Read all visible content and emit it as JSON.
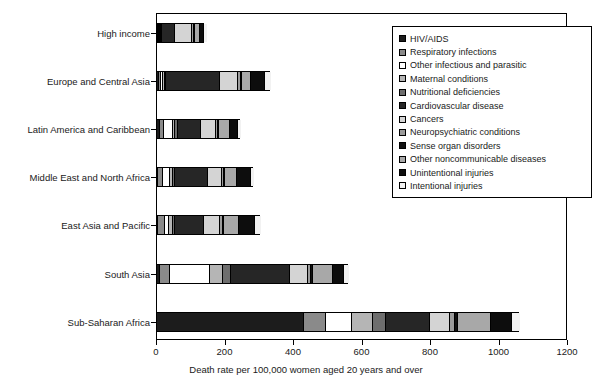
{
  "chart_data": {
    "type": "bar",
    "orientation": "horizontal",
    "stacked": true,
    "title": "",
    "xlabel": "Death rate per 100,000 women aged 20 years and over",
    "ylabel": "",
    "xlim": [
      0,
      1200
    ],
    "xticks": [
      0,
      200,
      400,
      600,
      800,
      1000,
      1200
    ],
    "xtick_labels": [
      "0",
      "200",
      "400",
      "600",
      "800",
      "1000",
      "1200"
    ],
    "grid": false,
    "legend_position": "upper right",
    "categories": [
      "High income",
      "Europe and Central Asia",
      "Latin America and Caribbean",
      "Middle East and North Africa",
      "East Asia and Pacific",
      "South Asia",
      "Sub-Saharan Africa"
    ],
    "series": [
      {
        "name": "HIV/AIDS",
        "color": "#1c1c1c",
        "pattern": "solid",
        "values": [
          2,
          5,
          8,
          3,
          4,
          10,
          430
        ]
      },
      {
        "name": "Respiratory infections",
        "color": "#8a8a8a",
        "pattern": "solid",
        "values": [
          4,
          8,
          12,
          14,
          18,
          28,
          62
        ]
      },
      {
        "name": "Other infectious and parasitic",
        "color": "#ffffff",
        "pattern": "solid",
        "values": [
          3,
          6,
          28,
          20,
          14,
          118,
          78
        ]
      },
      {
        "name": "Maternal conditions",
        "color": "#b5b5b5",
        "pattern": "hatch",
        "values": [
          1,
          3,
          6,
          9,
          10,
          36,
          60
        ]
      },
      {
        "name": "Nutritional deficiencies",
        "color": "#6e6e6e",
        "pattern": "solid",
        "values": [
          2,
          4,
          6,
          7,
          8,
          24,
          40
        ]
      },
      {
        "name": "Cardiovascular disease",
        "color": "#262626",
        "pattern": "dots",
        "values": [
          36,
          158,
          68,
          96,
          82,
          172,
          126
        ]
      },
      {
        "name": "Cancers",
        "color": "#d4d4d4",
        "pattern": "solid",
        "values": [
          50,
          54,
          44,
          40,
          48,
          52,
          60
        ]
      },
      {
        "name": "Neuropsychiatric conditions",
        "color": "#9b9b9b",
        "pattern": "hatch",
        "values": [
          6,
          6,
          6,
          6,
          8,
          10,
          14
        ]
      },
      {
        "name": "Sense organ disorders",
        "color": "#111111",
        "pattern": "solid",
        "values": [
          3,
          4,
          4,
          4,
          5,
          6,
          8
        ]
      },
      {
        "name": "Other noncommunicable diseases",
        "color": "#a8a8a8",
        "pattern": "hatch",
        "values": [
          14,
          26,
          30,
          34,
          44,
          58,
          96
        ]
      },
      {
        "name": "Unintentional injuries",
        "color": "#0d0d0d",
        "pattern": "solid",
        "values": [
          14,
          42,
          26,
          42,
          46,
          32,
          62
        ]
      },
      {
        "name": "Intentional injuries",
        "color": "#f2f2f2",
        "pattern": "solid",
        "values": [
          6,
          18,
          8,
          9,
          18,
          16,
          24
        ]
      }
    ],
    "totals": [
      141,
      334,
      246,
      284,
      305,
      562,
      1060
    ]
  },
  "axis": {
    "x_title": "Death rate per 100,000 women aged 20 years and over"
  },
  "legend": {
    "items": [
      "HIV/AIDS",
      "Respiratory infections",
      "Other infectious and parasitic",
      "Maternal conditions",
      "Nutritional deficiencies",
      "Cardiovascular disease",
      "Cancers",
      "Neuropsychiatric conditions",
      "Sense organ disorders",
      "Other noncommunicable diseases",
      "Unintentional injuries",
      "Intentional injuries"
    ]
  }
}
